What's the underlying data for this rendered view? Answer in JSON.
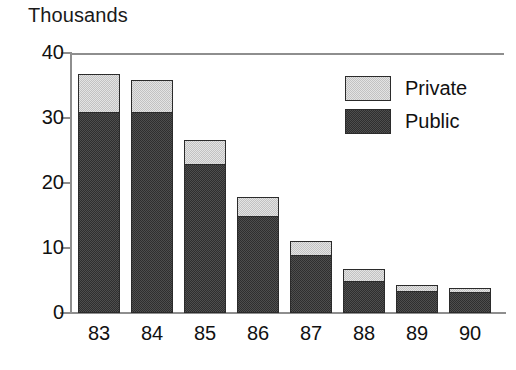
{
  "chart_data": {
    "type": "bar",
    "stacked": true,
    "title": "Thousands",
    "xlabel": "",
    "ylabel": "",
    "ylim": [
      0,
      40
    ],
    "yticks": [
      0,
      10,
      20,
      30,
      40
    ],
    "ytick_labels": [
      "0",
      "10",
      "20",
      "30",
      "40"
    ],
    "grid": false,
    "legend_position": "top-right",
    "categories": [
      "83",
      "84",
      "85",
      "86",
      "87",
      "88",
      "89",
      "90"
    ],
    "series": [
      {
        "name": "Public",
        "color": "#4e4e4e",
        "values": [
          31.0,
          31.0,
          23.0,
          15.0,
          8.9,
          5.0,
          3.4,
          3.3
        ]
      },
      {
        "name": "Private",
        "color": "#e4e4e4",
        "values": [
          5.7,
          4.8,
          3.6,
          2.9,
          2.2,
          1.7,
          0.9,
          0.6
        ]
      }
    ],
    "totals": [
      36.7,
      35.8,
      26.6,
      17.9,
      11.1,
      6.7,
      4.3,
      3.9
    ]
  },
  "legend": {
    "entries": [
      {
        "label": "Private",
        "swatch": "private-swatch"
      },
      {
        "label": "Public",
        "swatch": "public-swatch"
      }
    ]
  }
}
